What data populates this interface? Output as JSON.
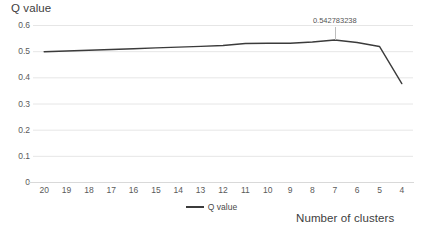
{
  "chart_data": {
    "type": "line",
    "title": "Q value",
    "subtitle": "",
    "xlabel": "Number of clusters",
    "ylabel": "",
    "categories": [
      20,
      19,
      18,
      17,
      16,
      15,
      14,
      13,
      12,
      11,
      10,
      9,
      8,
      7,
      6,
      5,
      4
    ],
    "series": [
      {
        "name": "Q value",
        "color": "#3b3b3b",
        "values": [
          0.4975,
          0.5005,
          0.5035,
          0.5065,
          0.5095,
          0.5125,
          0.5155,
          0.5185,
          0.5215,
          0.5295,
          0.53,
          0.53,
          0.535,
          0.542783238,
          0.533,
          0.518,
          0.376
        ]
      }
    ],
    "annotations": [
      {
        "text": "0.542783238",
        "x_category": 7,
        "value": 0.542783238
      }
    ],
    "xlim": [
      20,
      4
    ],
    "ylim": [
      0,
      0.6
    ],
    "y_ticks": [
      "0",
      "0.1",
      "0.2",
      "0.3",
      "0.4",
      "0.5",
      "0.6"
    ],
    "y_tick_values": [
      0,
      0.1,
      0.2,
      0.3,
      0.4,
      0.5,
      0.6
    ],
    "x_ticks": [
      "20",
      "19",
      "18",
      "17",
      "16",
      "15",
      "14",
      "13",
      "12",
      "11",
      "10",
      "9",
      "8",
      "7",
      "6",
      "5",
      "4"
    ],
    "grid": {
      "horizontal": true,
      "vertical": false,
      "color": "#e6e6e6"
    },
    "legend": {
      "position": "bottom",
      "entries": [
        {
          "label": "Q value",
          "color": "#3b3b3b",
          "marker": "line"
        }
      ]
    },
    "axis_line_color": "#d9d9d9",
    "background": "#ffffff"
  }
}
